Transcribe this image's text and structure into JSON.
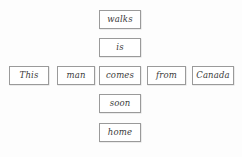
{
  "diagram": {
    "type": "word-slot-substitution-table",
    "canvas": {
      "width": 242,
      "height": 157,
      "background": "#fdfdfd"
    },
    "style": {
      "box_border_color": "#9a9a9a",
      "box_fill_color": "#ffffff",
      "text_color": "#3a3a3a",
      "text_style": "italic"
    },
    "base_sentence": "This man comes from Canada",
    "horizontal_row": {
      "label": "base-sentence-row",
      "cells": [
        {
          "text": "This",
          "x": 9,
          "y": 66,
          "w": 40,
          "h": 19
        },
        {
          "text": "man",
          "x": 57,
          "y": 66,
          "w": 38,
          "h": 19
        },
        {
          "text": "comes",
          "x": 99,
          "y": 66,
          "w": 42,
          "h": 19
        },
        {
          "text": "from",
          "x": 147,
          "y": 66,
          "w": 39,
          "h": 19
        },
        {
          "text": "Canada",
          "x": 192,
          "y": 66,
          "w": 42,
          "h": 19
        }
      ]
    },
    "vertical_column": {
      "label": "substitution-column",
      "anchor_cell_text": "comes",
      "cells": [
        {
          "text": "walks",
          "x": 99,
          "y": 10,
          "w": 42,
          "h": 19
        },
        {
          "text": "is",
          "x": 99,
          "y": 38,
          "w": 42,
          "h": 19
        },
        {
          "text": "comes",
          "x": 99,
          "y": 66,
          "w": 42,
          "h": 19
        },
        {
          "text": "soon",
          "x": 99,
          "y": 94,
          "w": 42,
          "h": 19
        },
        {
          "text": "home",
          "x": 99,
          "y": 123,
          "w": 42,
          "h": 19
        }
      ]
    },
    "all_words": [
      "walks",
      "is",
      "This",
      "man",
      "comes",
      "from",
      "Canada",
      "soon",
      "home"
    ]
  }
}
